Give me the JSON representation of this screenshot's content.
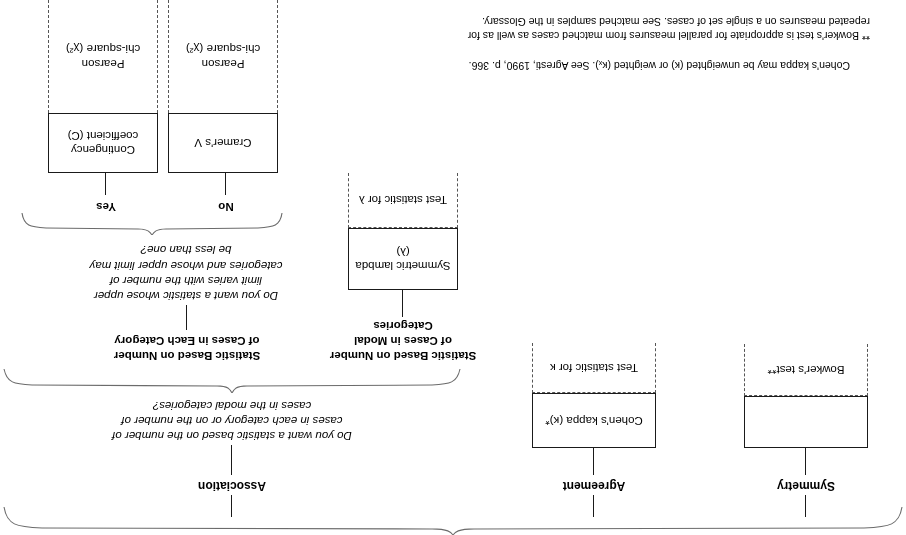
{
  "diagram": {
    "big_brace": {
      "name": "root-brace"
    },
    "branches": [
      {
        "id": "symmetry",
        "label": "Symmetry",
        "box_main_text": "",
        "box_dashed_text": "Bowker's test**"
      },
      {
        "id": "agreement",
        "label": "Agreement",
        "box_main_text": "Cohen's kappa (κ)*",
        "box_dashed_text": "Test statistic for κ"
      },
      {
        "id": "association",
        "label": "Association"
      }
    ],
    "association": {
      "question": "Do you want a statistic based on the number of cases in each category or on the number of cases in the modal categories?",
      "question_lines": [
        "Do you want a statistic based on the number of",
        "cases in each category or on the number of",
        "cases in the modal categories?"
      ],
      "left_heading_lines": [
        "Statistic Based on Number",
        "of Cases in Each Category"
      ],
      "left_heading": "Statistic Based on Number of Cases in Each Category",
      "right_heading_lines": [
        "Statistic Based on Number",
        "of Cases in Modal",
        "Categories"
      ],
      "right_heading": "Statistic Based on Number of Cases in Modal Categories",
      "modal": {
        "box_main_text": "Symmetric lambda (λ)",
        "box_dashed_text": "Test statistic for λ"
      },
      "each_category": {
        "question_lines": [
          "Do you want a statistic whose upper",
          "limit varies with the number of",
          "categories and whose upper limit may",
          "be less than one?"
        ],
        "question": "Do you want a statistic whose upper limit varies with the number of categories and whose upper limit may be less than one?",
        "options": [
          {
            "answer": "Yes",
            "box_main_text": "Contingency coefficient (C)",
            "box_main_lines": [
              "Contingency",
              "coefficient (C)"
            ],
            "box_dashed_lines": [
              "Pearson",
              "chi-square (χ²)"
            ],
            "box_dashed_text": "Pearson chi-square (χ²)"
          },
          {
            "answer": "No",
            "box_main_text": "Cramer's V",
            "box_main_lines": [
              "Cramer's V"
            ],
            "box_dashed_lines": [
              "Pearson",
              "chi-square (χ²)"
            ],
            "box_dashed_text": "Pearson chi-square (χ²)"
          }
        ]
      }
    },
    "footnotes": [
      {
        "marker": "*",
        "text": "Cohen's kappa may be unweighted (κ) or weighted (κₓ). See Agresti, 1990, p. 366."
      },
      {
        "marker": "**",
        "text": "Bowker's test is appropriate for parallel measures from matched cases as well as for repeated measures on a single set of cases. See matched samples in the Glossary.",
        "lines": [
          "** Bowker's test is appropriate for parallel measures from matched cases as well as for",
          "repeated measures on a single set of cases. See matched samples in the Glossary."
        ]
      }
    ]
  }
}
